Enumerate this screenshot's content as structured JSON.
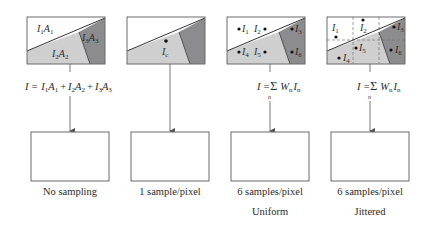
{
  "colors": {
    "background": "#ffffff",
    "region_white": "#ffffff",
    "region_light": "#cfcfd0",
    "region_dark": "#8c8c8e",
    "outline": "#6a6a6a",
    "text": "#2a2a2a"
  },
  "panels": [
    {
      "id": "no-sampling",
      "regions": [
        {
          "label": "I",
          "sub": "1",
          "label2": "A",
          "sub2": "1"
        },
        {
          "label": "I",
          "sub": "2",
          "label2": "A",
          "sub2": "2"
        },
        {
          "label": "I",
          "sub": "3",
          "label2": "A",
          "sub2": "3"
        }
      ],
      "formula": {
        "lhs": "I =",
        "terms": [
          {
            "I": "I",
            "Isub": "1",
            "A": "A",
            "Asub": "1"
          },
          {
            "I": "I",
            "Isub": "2",
            "A": "A",
            "Asub": "2"
          },
          {
            "I": "I",
            "Isub": "3",
            "A": "A",
            "Asub": "3"
          }
        ],
        "plus": "+"
      },
      "caption": "No sampling",
      "caption2": ""
    },
    {
      "id": "one-sample",
      "sample": {
        "label": "I",
        "sub": "c"
      },
      "formula": null,
      "caption": "1 sample/pixel",
      "caption2": ""
    },
    {
      "id": "uniform",
      "samples": [
        {
          "label": "I",
          "sub": "1"
        },
        {
          "label": "I",
          "sub": "2"
        },
        {
          "label": "I",
          "sub": "3"
        },
        {
          "label": "I",
          "sub": "4"
        },
        {
          "label": "I",
          "sub": "5"
        },
        {
          "label": "I",
          "sub": "6"
        }
      ],
      "formula": {
        "lhs": "I =",
        "sigma": "Σ",
        "sigma_sub": "n",
        "W": "W",
        "Wsub": "n",
        "I": "I",
        "Isub": "n"
      },
      "caption": "6 samples/pixel",
      "caption2": "Uniform"
    },
    {
      "id": "jittered",
      "samples": [
        {
          "label": "I",
          "sub": "1"
        },
        {
          "label": "I",
          "sub": "2"
        },
        {
          "label": "I",
          "sub": "3"
        },
        {
          "label": "I",
          "sub": "4"
        },
        {
          "label": "I",
          "sub": "5"
        },
        {
          "label": "I",
          "sub": "6"
        }
      ],
      "formula": {
        "lhs": "I =",
        "sigma": "Σ",
        "sigma_sub": "n",
        "W": "W",
        "Wsub": "n",
        "I": "I",
        "Isub": "n"
      },
      "caption": "6 samples/pixel",
      "caption2": "Jittered"
    }
  ]
}
